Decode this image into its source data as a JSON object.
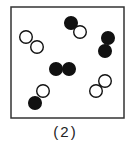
{
  "figure": {
    "caption": "(2)",
    "frame": {
      "x": 11,
      "y": 7,
      "width": 113,
      "height": 111,
      "stroke": "#333333"
    },
    "atom_radius": 6.3,
    "colors": {
      "filled": "#111111",
      "open_fill": "#ffffff",
      "open_stroke": "#111111"
    },
    "molecules": [
      {
        "name": "molecule-open-open-1",
        "atoms": [
          {
            "x": 26,
            "y": 37,
            "filled": false
          },
          {
            "x": 37,
            "y": 47,
            "filled": false
          }
        ]
      },
      {
        "name": "molecule-filled-open-1",
        "atoms": [
          {
            "x": 71,
            "y": 23,
            "filled": true
          },
          {
            "x": 80,
            "y": 32,
            "filled": false
          }
        ]
      },
      {
        "name": "molecule-filled-filled-1",
        "atoms": [
          {
            "x": 108,
            "y": 38,
            "filled": true
          },
          {
            "x": 105,
            "y": 51,
            "filled": true
          }
        ]
      },
      {
        "name": "molecule-filled-filled-2",
        "atoms": [
          {
            "x": 56,
            "y": 69,
            "filled": true
          },
          {
            "x": 69,
            "y": 69,
            "filled": true
          }
        ]
      },
      {
        "name": "molecule-open-filled-2",
        "atoms": [
          {
            "x": 43,
            "y": 91,
            "filled": false
          },
          {
            "x": 35,
            "y": 103,
            "filled": true
          }
        ]
      },
      {
        "name": "molecule-open-open-2",
        "atoms": [
          {
            "x": 105,
            "y": 81,
            "filled": false
          },
          {
            "x": 96,
            "y": 91,
            "filled": false
          }
        ]
      }
    ]
  }
}
